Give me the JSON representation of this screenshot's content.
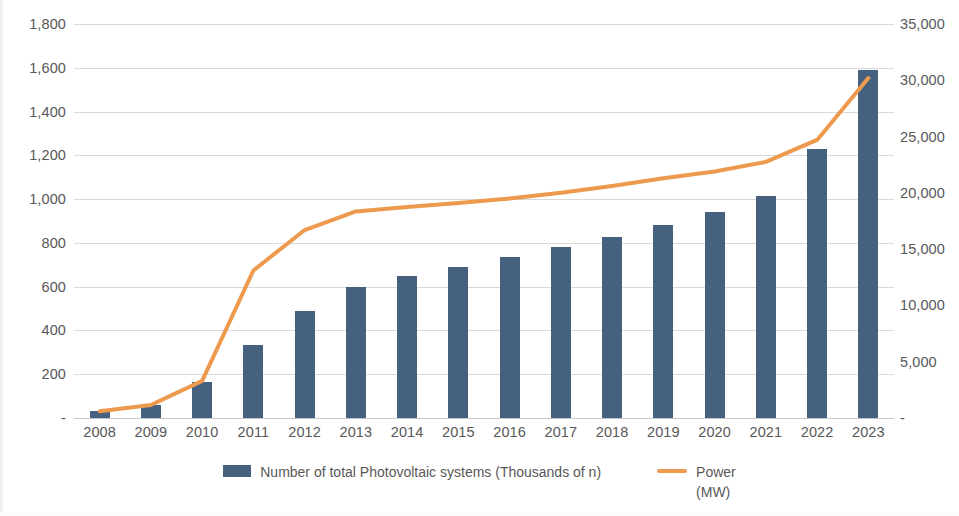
{
  "chart_data": {
    "type": "bar",
    "title": "",
    "subtitle": "",
    "xlabel": "",
    "ylabel": "",
    "grid": true,
    "legend_position": "bottom",
    "categories": [
      "2008",
      "2009",
      "2010",
      "2011",
      "2012",
      "2013",
      "2014",
      "2015",
      "2016",
      "2017",
      "2018",
      "2019",
      "2020",
      "2021",
      "2022",
      "2023"
    ],
    "series": [
      {
        "name": "Number of total Photovoltaic systems (Thousands of n)",
        "type": "bar",
        "axis": "left",
        "color": "#46617f",
        "values": [
          32,
          59,
          165,
          334,
          489,
          600,
          650,
          692,
          737,
          780,
          825,
          884,
          941,
          1016,
          1229,
          1592
        ]
      },
      {
        "name": "Power (MW)",
        "type": "line",
        "axis": "right",
        "color": "#ed9a4e",
        "values": [
          600,
          1150,
          3300,
          13100,
          16700,
          18350,
          18750,
          19100,
          19500,
          20000,
          20600,
          21300,
          21900,
          22750,
          24700,
          30200
        ]
      }
    ],
    "axes": {
      "left": {
        "min": 0,
        "max": 1800,
        "step": 200,
        "ticks": [
          "-",
          "200",
          "400",
          "600",
          "800",
          "1,000",
          "1,200",
          "1,400",
          "1,600",
          "1,800"
        ]
      },
      "right": {
        "min": 0,
        "max": 35000,
        "step": 5000,
        "ticks": [
          "-",
          "5,000",
          "10,000",
          "15,000",
          "20,000",
          "25,000",
          "30,000",
          "35,000"
        ]
      }
    }
  },
  "legend": {
    "items": [
      {
        "label": "Number of total Photovoltaic systems (Thousands of n)",
        "marker": "bar-swatch",
        "color": "#46617f"
      },
      {
        "label": "Power\n(MW)",
        "marker": "line-swatch",
        "color": "#ed9a4e"
      }
    ]
  }
}
